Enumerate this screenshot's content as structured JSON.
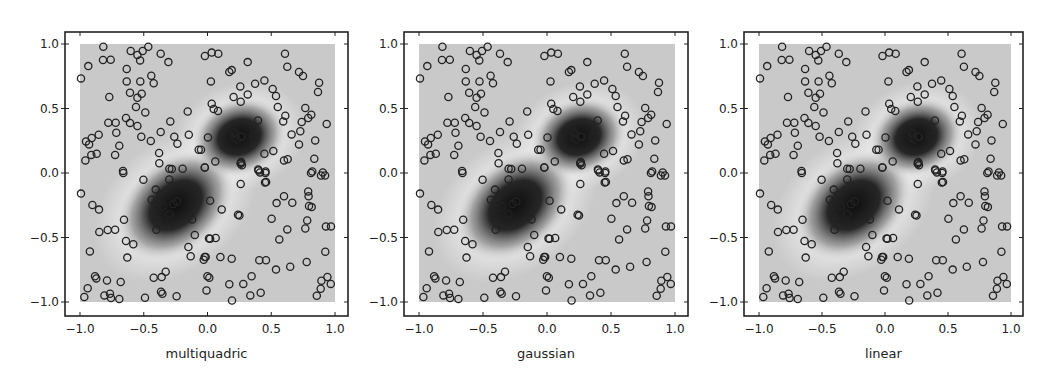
{
  "figure": {
    "panels": [
      {
        "id": "multiquadric",
        "xlabel": "multiquadric",
        "frame": {
          "left": 65,
          "right": 348,
          "top": 32,
          "bottom": 316
        },
        "data_px": {
          "x0": 80,
          "x1": 335,
          "y1": 44,
          "y0": 302
        }
      },
      {
        "id": "gaussian",
        "xlabel": "gaussian",
        "frame": {
          "left": 404,
          "right": 688,
          "top": 32,
          "bottom": 316
        },
        "data_px": {
          "x0": 419,
          "x1": 675,
          "y1": 44,
          "y0": 302
        }
      },
      {
        "id": "linear",
        "xlabel": "linear",
        "frame": {
          "left": 744,
          "right": 1023,
          "top": 32,
          "bottom": 316
        },
        "data_px": {
          "x0": 759,
          "x1": 1011,
          "y1": 44,
          "y0": 302
        }
      }
    ]
  },
  "chart_data": {
    "type": "scatter",
    "title": "",
    "subplots": [
      "multiquadric",
      "gaussian",
      "linear"
    ],
    "xlabel_per_subplot": [
      "multiquadric",
      "gaussian",
      "linear"
    ],
    "ylabel": "",
    "xlim": [
      -1.1,
      1.1
    ],
    "ylim": [
      -1.1,
      1.1
    ],
    "xticks": [
      -1.0,
      -0.5,
      0.0,
      0.5,
      1.0
    ],
    "yticks": [
      -1.0,
      -0.5,
      0.0,
      0.5,
      1.0
    ],
    "xtick_labels": [
      "−1.0",
      "−0.5",
      "0.0",
      "0.5",
      "1.0"
    ],
    "ytick_labels": [
      "−1.0",
      "−0.5",
      "0.0",
      "0.5",
      "1.0"
    ],
    "grid": false,
    "colormap": "gray",
    "field_extent": [
      -1,
      1,
      -1,
      1
    ],
    "field_features": [
      {
        "type": "dark_blob",
        "center": [
          -0.25,
          -0.25
        ],
        "approx_radii": [
          0.38,
          0.24
        ],
        "angle_deg": -40
      },
      {
        "type": "dark_blob",
        "center": [
          0.25,
          0.28
        ],
        "approx_radii": [
          0.28,
          0.2
        ],
        "angle_deg": -20
      }
    ],
    "marker": "open circle",
    "points": [
      [
        -0.817,
        0.979
      ],
      [
        -0.602,
        0.946
      ],
      [
        -0.55,
        0.915
      ],
      [
        -0.508,
        0.946
      ],
      [
        -0.464,
        0.979
      ],
      [
        -0.367,
        0.925
      ],
      [
        -0.307,
        0.86
      ],
      [
        -0.529,
        0.873
      ],
      [
        -0.82,
        0.876
      ],
      [
        -0.759,
        0.878
      ],
      [
        -0.935,
        0.829
      ],
      [
        -0.992,
        0.733
      ],
      [
        -0.634,
        0.806
      ],
      [
        -0.441,
        0.754
      ],
      [
        -0.422,
        0.695
      ],
      [
        -0.634,
        0.71
      ],
      [
        -0.527,
        0.71
      ],
      [
        -0.608,
        0.622
      ],
      [
        -0.55,
        0.584
      ],
      [
        -0.516,
        0.615
      ],
      [
        -0.77,
        0.589
      ],
      [
        -0.561,
        0.512
      ],
      [
        -0.488,
        0.47
      ],
      [
        -0.155,
        0.477
      ],
      [
        -0.639,
        0.426
      ],
      [
        -0.608,
        0.388
      ],
      [
        -0.55,
        0.364
      ],
      [
        -0.778,
        0.39
      ],
      [
        -0.72,
        0.39
      ],
      [
        -0.715,
        0.312
      ],
      [
        -0.292,
        0.4
      ],
      [
        -0.367,
        0.318
      ],
      [
        -0.519,
        0.281
      ],
      [
        -0.445,
        0.248
      ],
      [
        -0.26,
        0.281
      ],
      [
        -0.236,
        0.227
      ],
      [
        -0.147,
        0.297
      ],
      [
        -0.853,
        0.297
      ],
      [
        -0.908,
        0.271
      ],
      [
        -0.953,
        0.245
      ],
      [
        -0.929,
        0.222
      ],
      [
        -0.692,
        0.212
      ],
      [
        -0.869,
        0.15
      ],
      [
        -0.911,
        0.14
      ],
      [
        -0.958,
        0.098
      ],
      [
        -0.725,
        0.14
      ],
      [
        -0.069,
        0.181
      ],
      [
        -0.38,
        0.155
      ],
      [
        -0.378,
        0.075
      ],
      [
        -0.3,
        0.033
      ],
      [
        -0.195,
        0.033
      ],
      [
        -0.022,
        0.043
      ],
      [
        -0.663,
        0.016
      ],
      [
        -0.02,
        0.907
      ],
      [
        0.033,
        0.933
      ],
      [
        0.085,
        0.925
      ],
      [
        0.315,
        0.86
      ],
      [
        0.608,
        0.925
      ],
      [
        0.626,
        0.824
      ],
      [
        0.19,
        0.798
      ],
      [
        0.171,
        0.783
      ],
      [
        0.718,
        0.783
      ],
      [
        0.749,
        0.752
      ],
      [
        0.027,
        0.71
      ],
      [
        0.446,
        0.718
      ],
      [
        0.373,
        0.692
      ],
      [
        0.257,
        0.671
      ],
      [
        0.875,
        0.7
      ],
      [
        0.867,
        0.628
      ],
      [
        0.511,
        0.651
      ],
      [
        0.537,
        0.597
      ],
      [
        0.205,
        0.589
      ],
      [
        0.26,
        0.553
      ],
      [
        0.315,
        0.609
      ],
      [
        0.033,
        0.537
      ],
      [
        0.049,
        0.496
      ],
      [
        0.082,
        0.481
      ],
      [
        0.551,
        0.512
      ],
      [
        0.767,
        0.504
      ],
      [
        0.79,
        0.426
      ],
      [
        0.814,
        0.452
      ],
      [
        0.61,
        0.444
      ],
      [
        0.594,
        0.4
      ],
      [
        0.739,
        0.395
      ],
      [
        0.935,
        0.38
      ],
      [
        0.396,
        0.408
      ],
      [
        0.728,
        0.323
      ],
      [
        0.66,
        0.299
      ],
      [
        0.004,
        0.276
      ],
      [
        0.208,
        0.315
      ],
      [
        0.21,
        0.276
      ],
      [
        0.263,
        0.284
      ],
      [
        0.357,
        0.289
      ],
      [
        0.718,
        0.222
      ],
      [
        0.845,
        0.253
      ],
      [
        -0.051,
        0.181
      ],
      [
        0.446,
        0.15
      ],
      [
        0.516,
        0.171
      ],
      [
        0.838,
        0.111
      ],
      [
        0.6,
        0.098
      ],
      [
        0.629,
        0.106
      ],
      [
        -0.02,
        0.043
      ],
      [
        0.061,
        0.09
      ],
      [
        0.26,
        0.072
      ],
      [
        0.265,
        0.085
      ],
      [
        0.398,
        0.028
      ],
      [
        0.456,
        0.012
      ],
      [
        0.822,
        0.012
      ],
      [
        0.904,
        0.005
      ],
      [
        -0.66,
        0.0
      ],
      [
        -0.503,
        -0.052
      ],
      [
        -0.992,
        -0.16
      ],
      [
        -0.406,
        -0.129
      ],
      [
        -0.438,
        -0.207
      ],
      [
        -0.903,
        -0.248
      ],
      [
        -0.851,
        -0.284
      ],
      [
        -0.401,
        -0.349
      ],
      [
        -0.655,
        -0.362
      ],
      [
        -0.401,
        -0.44
      ],
      [
        -0.849,
        -0.457
      ],
      [
        -0.783,
        -0.442
      ],
      [
        -0.725,
        -0.44
      ],
      [
        -0.639,
        -0.527
      ],
      [
        -0.582,
        -0.553
      ],
      [
        -0.922,
        -0.608
      ],
      [
        -0.629,
        -0.656
      ],
      [
        -0.15,
        -0.574
      ],
      [
        -0.132,
        -0.646
      ],
      [
        -0.03,
        -0.672
      ],
      [
        -0.014,
        -0.651
      ],
      [
        -0.882,
        -0.801
      ],
      [
        -0.872,
        -0.817
      ],
      [
        -0.788,
        -0.833
      ],
      [
        -0.681,
        -0.845
      ],
      [
        -0.422,
        -0.812
      ],
      [
        -0.359,
        -0.807
      ],
      [
        -0.328,
        -0.765
      ],
      [
        -0.94,
        -0.894
      ],
      [
        -0.966,
        -0.961
      ],
      [
        -0.809,
        -0.949
      ],
      [
        -0.765,
        -0.936
      ],
      [
        -0.757,
        -0.969
      ],
      [
        -0.692,
        -0.977
      ],
      [
        -0.49,
        -0.967
      ],
      [
        -0.365,
        -0.92
      ],
      [
        -0.354,
        -0.936
      ],
      [
        -0.242,
        -0.956
      ],
      [
        -0.001,
        -0.801
      ],
      [
        -0.008,
        -0.91
      ],
      [
        -0.37,
        -0.17
      ],
      [
        -0.35,
        -0.26
      ],
      [
        -0.3,
        -0.32
      ],
      [
        -0.27,
        -0.24
      ],
      [
        -0.24,
        -0.22
      ],
      [
        -0.3,
        -0.05
      ],
      [
        -0.12,
        -0.36
      ],
      [
        -0.1,
        -0.48
      ],
      [
        0.02,
        -0.51
      ],
      [
        -0.28,
        0.03
      ],
      [
        0.412,
        0.005
      ],
      [
        0.454,
        0.0
      ],
      [
        0.451,
        -0.073
      ],
      [
        0.26,
        -0.085
      ],
      [
        0.812,
        0.0
      ],
      [
        0.89,
        -0.019
      ],
      [
        0.922,
        -0.019
      ],
      [
        0.6,
        -0.181
      ],
      [
        0.542,
        -0.233
      ],
      [
        0.665,
        -0.23
      ],
      [
        0.79,
        -0.143
      ],
      [
        0.793,
        -0.181
      ],
      [
        0.796,
        -0.256
      ],
      [
        0.817,
        -0.264
      ],
      [
        0.02,
        -0.215
      ],
      [
        0.111,
        -0.282
      ],
      [
        0.239,
        -0.323
      ],
      [
        0.503,
        -0.354
      ],
      [
        0.782,
        -0.368
      ],
      [
        0.767,
        -0.43
      ],
      [
        0.626,
        -0.437
      ],
      [
        0.929,
        -0.414
      ],
      [
        0.969,
        -0.414
      ],
      [
        0.012,
        -0.507
      ],
      [
        0.064,
        -0.504
      ],
      [
        0.563,
        -0.515
      ],
      [
        0.924,
        -0.61
      ],
      [
        -0.022,
        -0.651
      ],
      [
        0.101,
        -0.651
      ],
      [
        0.19,
        -0.664
      ],
      [
        0.406,
        -0.677
      ],
      [
        0.459,
        -0.677
      ],
      [
        0.778,
        -0.69
      ],
      [
        0.537,
        -0.749
      ],
      [
        0.649,
        -0.726
      ],
      [
        0.014,
        -0.812
      ],
      [
        0.346,
        -0.801
      ],
      [
        0.281,
        -0.86
      ],
      [
        0.171,
        -0.863
      ],
      [
        0.94,
        -0.806
      ],
      [
        0.893,
        -0.835
      ],
      [
        0.967,
        -0.86
      ],
      [
        0.888,
        -0.897
      ],
      [
        0.857,
        -0.952
      ],
      [
        0.336,
        -0.949
      ],
      [
        0.417,
        -0.928
      ],
      [
        0.192,
        -0.988
      ],
      [
        0.22,
        0.3
      ],
      [
        0.23,
        0.26
      ],
      [
        0.27,
        0.28
      ],
      [
        0.27,
        0.06
      ],
      [
        0.26,
        0.08
      ],
      [
        0.37,
        0.28
      ],
      [
        0.4,
        0.02
      ],
      [
        0.46,
        -0.07
      ],
      [
        0.25,
        -0.33
      ]
    ]
  },
  "colors": {
    "background": "#ffffff",
    "field_base": "#c9c9c9",
    "field_halo": "#e6e6e6",
    "blob_core": "#111111",
    "axis": "#222222",
    "marker_stroke": "#222222"
  }
}
